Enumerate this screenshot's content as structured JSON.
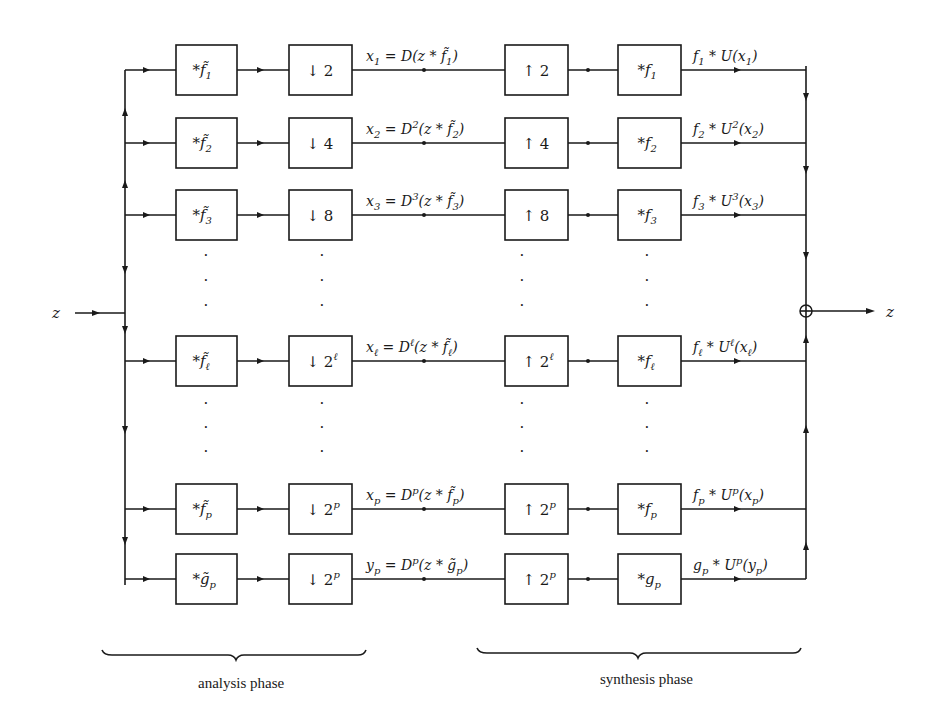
{
  "diagram": {
    "input_label": "z",
    "output_label": "z",
    "sum_node": "sum-junction",
    "rows": [
      {
        "id": "1",
        "analysis_filter": {
          "prefix": "*",
          "base": "f̃",
          "sub": "1"
        },
        "downsample": {
          "arrow": "↓",
          "base": "2",
          "sup": ""
        },
        "signal": {
          "lhs": "x",
          "lhs_sub": "1",
          "eq": " = D",
          "op_sup": "",
          "arg": "(z * f̃",
          "arg_sub": "1",
          "close": ")"
        },
        "upsample": {
          "arrow": "↑",
          "base": "2",
          "sup": ""
        },
        "synthesis_filter": {
          "prefix": "*",
          "base": "f",
          "sub": "1"
        },
        "output": {
          "f": "f",
          "f_sub": "1",
          "mid": " * U",
          "op_sup": "",
          "arg": "(x",
          "arg_sub": "1",
          "close": ")"
        }
      },
      {
        "id": "2",
        "analysis_filter": {
          "prefix": "*",
          "base": "f̃",
          "sub": "2"
        },
        "downsample": {
          "arrow": "↓",
          "base": "4",
          "sup": ""
        },
        "signal": {
          "lhs": "x",
          "lhs_sub": "2",
          "eq": " = D",
          "op_sup": "2",
          "arg": "(z * f̃",
          "arg_sub": "2",
          "close": ")"
        },
        "upsample": {
          "arrow": "↑",
          "base": "4",
          "sup": ""
        },
        "synthesis_filter": {
          "prefix": "*",
          "base": "f",
          "sub": "2"
        },
        "output": {
          "f": "f",
          "f_sub": "2",
          "mid": " * U",
          "op_sup": "2",
          "arg": "(x",
          "arg_sub": "2",
          "close": ")"
        }
      },
      {
        "id": "3",
        "analysis_filter": {
          "prefix": "*",
          "base": "f̃",
          "sub": "3"
        },
        "downsample": {
          "arrow": "↓",
          "base": "8",
          "sup": ""
        },
        "signal": {
          "lhs": "x",
          "lhs_sub": "3",
          "eq": " = D",
          "op_sup": "3",
          "arg": "(z * f̃",
          "arg_sub": "3",
          "close": ")"
        },
        "upsample": {
          "arrow": "↑",
          "base": "8",
          "sup": ""
        },
        "synthesis_filter": {
          "prefix": "*",
          "base": "f",
          "sub": "3"
        },
        "output": {
          "f": "f",
          "f_sub": "3",
          "mid": " * U",
          "op_sup": "3",
          "arg": "(x",
          "arg_sub": "3",
          "close": ")"
        }
      },
      {
        "id": "l",
        "analysis_filter": {
          "prefix": "*",
          "base": "f̃",
          "sub": "ℓ"
        },
        "downsample": {
          "arrow": "↓",
          "base": "2",
          "sup": "ℓ"
        },
        "signal": {
          "lhs": "x",
          "lhs_sub": "ℓ",
          "eq": " = D",
          "op_sup": "ℓ",
          "arg": "(z * f̃",
          "arg_sub": "ℓ",
          "close": ")"
        },
        "upsample": {
          "arrow": "↑",
          "base": "2",
          "sup": "ℓ"
        },
        "synthesis_filter": {
          "prefix": "*",
          "base": "f",
          "sub": "ℓ"
        },
        "output": {
          "f": "f",
          "f_sub": "ℓ",
          "mid": " * U",
          "op_sup": "ℓ",
          "arg": "(x",
          "arg_sub": "ℓ",
          "close": ")"
        }
      },
      {
        "id": "p",
        "analysis_filter": {
          "prefix": "*",
          "base": "f̃",
          "sub": "p"
        },
        "downsample": {
          "arrow": "↓",
          "base": "2",
          "sup": "p"
        },
        "signal": {
          "lhs": "x",
          "lhs_sub": "p",
          "eq": " = D",
          "op_sup": "p",
          "arg": "(z * f̃",
          "arg_sub": "p",
          "close": ")"
        },
        "upsample": {
          "arrow": "↑",
          "base": "2",
          "sup": "p"
        },
        "synthesis_filter": {
          "prefix": "*",
          "base": "f",
          "sub": "p"
        },
        "output": {
          "f": "f",
          "f_sub": "p",
          "mid": " * U",
          "op_sup": "p",
          "arg": "(x",
          "arg_sub": "p",
          "close": ")"
        }
      },
      {
        "id": "g",
        "analysis_filter": {
          "prefix": "*",
          "base": "g̃",
          "sub": "p"
        },
        "downsample": {
          "arrow": "↓",
          "base": "2",
          "sup": "p"
        },
        "signal": {
          "lhs": "y",
          "lhs_sub": "p",
          "eq": " = D",
          "op_sup": "p",
          "arg": "(z * g̃",
          "arg_sub": "p",
          "close": ")"
        },
        "upsample": {
          "arrow": "↑",
          "base": "2",
          "sup": "p"
        },
        "synthesis_filter": {
          "prefix": "*",
          "base": "g",
          "sub": "p"
        },
        "output": {
          "f": "g",
          "f_sub": "p",
          "mid": " * U",
          "op_sup": "p",
          "arg": "(y",
          "arg_sub": "p",
          "close": ")"
        }
      }
    ],
    "ellipsis": "·",
    "phases": {
      "analysis": "analysis phase",
      "synthesis": "synthesis phase"
    }
  }
}
